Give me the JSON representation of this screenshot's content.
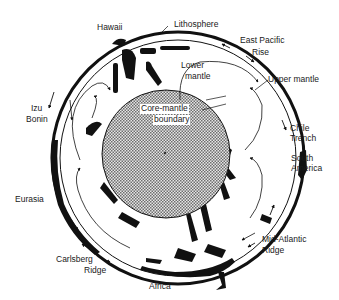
{
  "diagram": {
    "type": "cross-section",
    "colors": {
      "background": "#ffffff",
      "ink": "#111111",
      "core_fill_a": "#7a7a7a",
      "core_fill_b": "#e6e6e6"
    },
    "labels": {
      "lithosphere": "Lithosphere",
      "hawaii": "Hawaii",
      "east_pacific": "East  Pacific",
      "rise": "Rise",
      "lower": "Lower",
      "mantle": "mantle",
      "upper_mantle": "Upper  mantle",
      "izu": "Izu",
      "bonin": "Bonin",
      "core_mantle": "Core-mantle",
      "boundary": "boundary",
      "chile": "Chile",
      "trench": "Trench",
      "south": "South",
      "america": "America",
      "eurasia": "Eurasia",
      "carlsberg": "Carlsberg",
      "ridge_left": "Ridge",
      "mid_atlantic": "Mid-Atlantic",
      "ridge_right": "Ridge",
      "africa": "Africa"
    }
  }
}
